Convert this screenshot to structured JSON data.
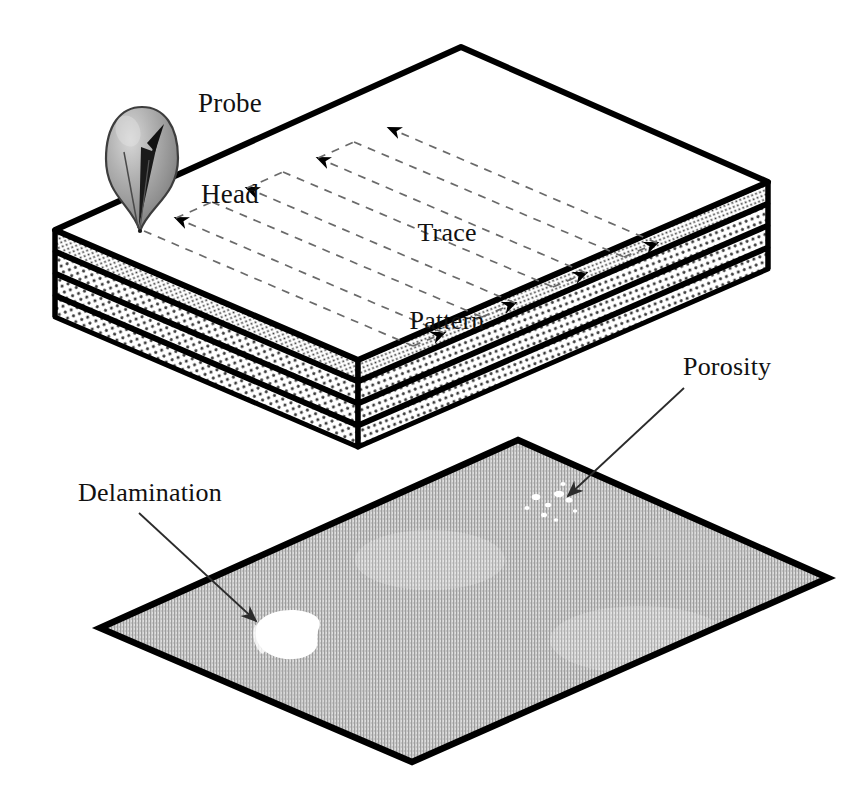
{
  "figure": {
    "background_color": "#ffffff",
    "width": 867,
    "height": 796
  },
  "labels": {
    "probe_head": {
      "line1": "Probe",
      "line2": "Head"
    },
    "trace_pattern": {
      "line1": "Trace",
      "line2": "Pattern"
    },
    "porosity": "Porosity",
    "delamination": "Delamination"
  },
  "colors": {
    "outline": "#000000",
    "text": "#111111",
    "leader": "#2b2b2b",
    "trace_dash": "#6a6a6a",
    "arrowhead": "#000000",
    "ply_speckle_fill": "#ffffff",
    "ply_speckle_dot": "#3a3a3a",
    "slab_top_face": "#ffffff",
    "cscan_base": "#d9d9d9",
    "cscan_stripe": "#9a9a9a",
    "defect_white": "#ffffff",
    "probe_body_light": "#d0d0d0",
    "probe_body_mid": "#9c9c9c",
    "probe_body_dark": "#6f6f6f",
    "probe_outline": "#3d3d3d"
  },
  "laminate_block": {
    "description": "Isometric composite laminate block, four plies",
    "top_face": [
      [
        461,
        47
      ],
      [
        768,
        182
      ],
      [
        358,
        360
      ],
      [
        55,
        230
      ]
    ],
    "ply_count": 4,
    "total_thickness_px": 86,
    "corners": {
      "back": [
        461,
        47
      ],
      "right": [
        768,
        182
      ],
      "front": [
        358,
        360
      ],
      "left": [
        55,
        230
      ]
    }
  },
  "probe": {
    "name": "probe-head",
    "bulb_center": [
      141,
      147
    ],
    "bulb_rx": 36,
    "bulb_ry": 40,
    "tip": [
      140,
      230
    ],
    "arrow_from": [
      121,
      205
    ],
    "arrow_to": [
      163,
      128
    ]
  },
  "trace_pattern": {
    "type": "serpentine-raster-scan",
    "dash": "8 7",
    "stroke_width": 1.6,
    "start_point": [
      144,
      231
    ],
    "passes": 4,
    "arrow_count": 8
  },
  "cscan_panel": {
    "description": "C-scan image plane below the laminate",
    "corners": {
      "top": [
        518,
        440
      ],
      "right": [
        828,
        578
      ],
      "bottom": [
        412,
        762
      ],
      "left": [
        100,
        628
      ]
    },
    "defects": [
      {
        "name": "delamination",
        "type": "blob",
        "center": [
          288,
          633
        ],
        "w": 62,
        "h": 42
      },
      {
        "name": "porosity",
        "type": "scattered-voids",
        "center": [
          554,
          508
        ],
        "count": 9
      }
    ]
  },
  "leaders": [
    {
      "name": "porosity-leader",
      "from": [
        684,
        388
      ],
      "to": [
        565,
        498
      ]
    },
    {
      "name": "delamination-leader",
      "from": [
        138,
        512
      ],
      "to": [
        255,
        620
      ]
    }
  ]
}
